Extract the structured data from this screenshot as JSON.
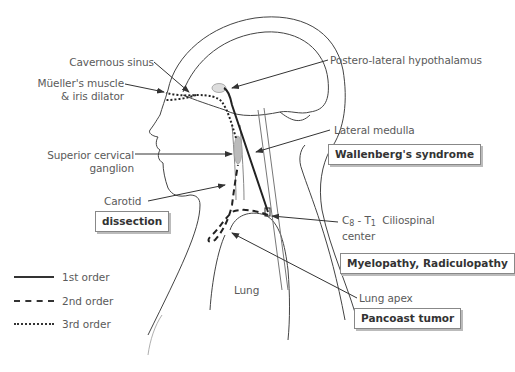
{
  "labels": {
    "cavernous_sinus": "Cavernous sinus",
    "mueller_muscle_line1": "Müeller's muscle",
    "mueller_muscle_line2": "& iris dilator",
    "postero_lateral_hypothalamus": "Postero-lateral hypothalamus",
    "lateral_medulla": "Lateral medulla",
    "superior_cervical_line1": "Superior cervical",
    "superior_cervical_line2": "ganglion",
    "carotid": "Carotid",
    "ciliospinal_c": "C",
    "ciliospinal_c_sub": "8",
    "ciliospinal_sep": " - T",
    "ciliospinal_t_sub": "1",
    "ciliospinal_rest": "  Ciliospinal",
    "ciliospinal_line2": "center",
    "lung": "Lung",
    "lung_apex": "Lung apex"
  },
  "boxes": {
    "wallenberg": "Wallenberg's syndrome",
    "dissection": "dissection",
    "myelopathy": "Myelopathy, Radiculopathy",
    "pancoast": "Pancoast tumor"
  },
  "legend": {
    "items": [
      {
        "style": "solid",
        "label": "1st order"
      },
      {
        "style": "dashed",
        "label": "2nd order"
      },
      {
        "style": "dotted",
        "label": "3rd order"
      }
    ]
  },
  "colors": {
    "line": "#333333",
    "text": "#5a5a5a",
    "box_border": "#888888"
  }
}
